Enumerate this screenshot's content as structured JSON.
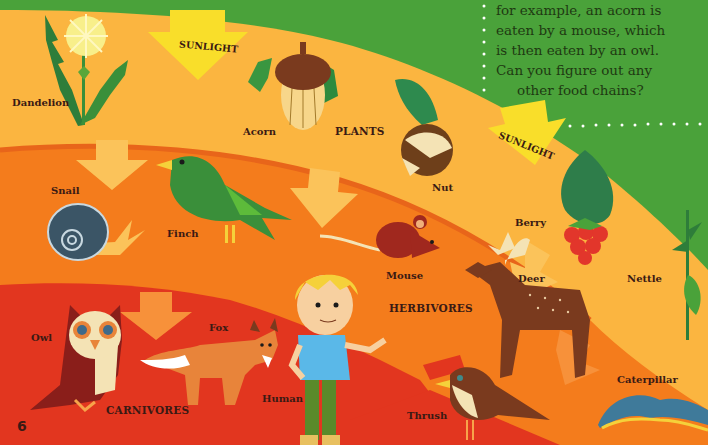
{
  "page": {
    "page_number": "6",
    "intro_text_lines": [
      "for example, an acorn is",
      "eaten by a mouse, which",
      "is then eaten by an owl.",
      "Can you figure out any",
      "other food chains?"
    ]
  },
  "colors": {
    "sky_green": "#4aa23a",
    "plants_band": "#fbb540",
    "herbivores_band": "#f47c1c",
    "carnivores_band": "#e2361f",
    "sunlight_arrow": "#f9de2a",
    "label_text": "#3a1a14"
  },
  "bands": {
    "plants": "PLANTS",
    "herbivores": "HERBIVORES",
    "carnivores": "CARNIVORES"
  },
  "sunlight_labels": [
    "SUNLIGHT",
    "SUNLIGHT"
  ],
  "organisms": {
    "dandelion": "Dandelion",
    "acorn": "Acorn",
    "nut": "Nut",
    "berry": "Berry",
    "nettle": "Nettle",
    "snail": "Snail",
    "finch": "Finch",
    "mouse": "Mouse",
    "deer": "Deer",
    "caterpillar": "Caterpillar",
    "owl": "Owl",
    "fox": "Fox",
    "human": "Human",
    "thrush": "Thrush"
  }
}
